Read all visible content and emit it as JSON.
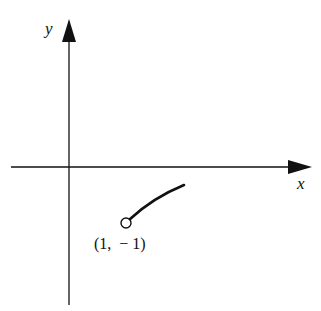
{
  "diagram": {
    "axes": {
      "x_label": "x",
      "y_label": "y"
    },
    "curve": {
      "description": "increasing concave-down curve starting at open circle",
      "start_point": {
        "x": 1,
        "y": -1,
        "open": true
      }
    },
    "point_label": "(1,  − 1)",
    "colors": {
      "stroke": "#111111",
      "background": "#ffffff"
    }
  }
}
